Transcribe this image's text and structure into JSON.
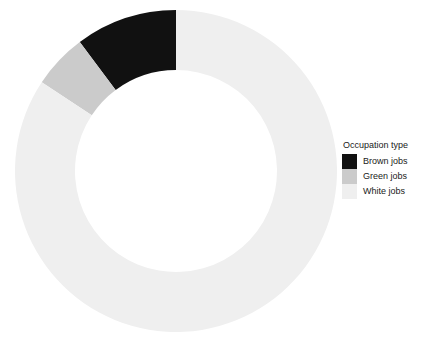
{
  "chart_data": {
    "type": "pie",
    "variant": "donut",
    "title": "",
    "subtitle": "",
    "xlabel": "",
    "ylabel": "",
    "legend_title": "Occupation type",
    "legend_position": "right",
    "grid": false,
    "start_angle_deg": 0,
    "direction": "counterclockwise",
    "categories": [
      "Brown jobs",
      "Green jobs",
      "White jobs"
    ],
    "values": [
      10.2,
      5.5,
      84.3
    ],
    "value_unit": "percent",
    "colors": [
      "#111111",
      "#cbcbcb",
      "#efefef"
    ],
    "slices": [
      {
        "label": "Brown jobs",
        "value": 10.2,
        "color": "#111111",
        "start_deg": 0.0,
        "end_deg": 36.7
      },
      {
        "label": "Green jobs",
        "value": 5.5,
        "color": "#cbcbcb",
        "start_deg": 36.7,
        "end_deg": 56.5
      },
      {
        "label": "White jobs",
        "value": 84.3,
        "color": "#efefef",
        "start_deg": 56.5,
        "end_deg": 360.0
      }
    ],
    "geometry": {
      "center_x": 176,
      "center_y": 171,
      "outer_radius": 161,
      "inner_radius": 101
    }
  },
  "legend": {
    "title": "Occupation type",
    "items": [
      {
        "label": "Brown jobs",
        "color": "#111111"
      },
      {
        "label": "Green jobs",
        "color": "#cbcbcb"
      },
      {
        "label": "White jobs",
        "color": "#efefef"
      }
    ]
  }
}
